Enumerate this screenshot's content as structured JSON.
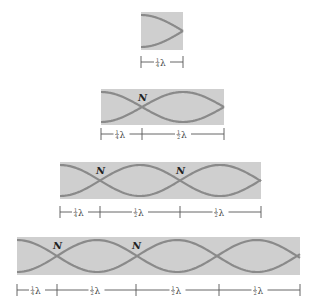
{
  "figure": {
    "colors": {
      "tube_fill": "#cfcfcf",
      "wave_stroke": "#8a8a8a",
      "dimension_line": "#555555"
    },
    "node_label": "N",
    "quarter_label": "¼λ",
    "half_label": "½λ",
    "panels": [
      {
        "id": "p1",
        "x": 141,
        "y": 12,
        "w": 42,
        "h": 38,
        "bracket_y": 62,
        "segments": [
          {
            "from": 141,
            "to": 183,
            "label": "¼λ"
          }
        ],
        "nodes": []
      },
      {
        "id": "p2",
        "x": 101,
        "y": 89,
        "w": 123,
        "h": 36,
        "bracket_y": 134,
        "segments": [
          {
            "from": 101,
            "to": 142,
            "label": "¼λ"
          },
          {
            "from": 142,
            "to": 224,
            "label": "½λ"
          }
        ],
        "nodes": [
          142
        ]
      },
      {
        "id": "p3",
        "x": 60,
        "y": 162,
        "w": 201,
        "h": 37,
        "bracket_y": 212,
        "segments": [
          {
            "from": 60,
            "to": 100,
            "label": "¼λ"
          },
          {
            "from": 100,
            "to": 180,
            "label": "½λ"
          },
          {
            "from": 180,
            "to": 261,
            "label": "½λ"
          }
        ],
        "nodes": [
          100,
          180
        ]
      },
      {
        "id": "p4",
        "x": 17,
        "y": 237,
        "w": 283,
        "h": 38,
        "bracket_y": 290,
        "segments": [
          {
            "from": 17,
            "to": 57,
            "label": "¼λ"
          },
          {
            "from": 57,
            "to": 136,
            "label": "½λ"
          },
          {
            "from": 136,
            "to": 219,
            "label": "½λ"
          },
          {
            "from": 219,
            "to": 300,
            "label": "½λ"
          }
        ],
        "nodes": [
          57,
          136
        ]
      }
    ]
  }
}
